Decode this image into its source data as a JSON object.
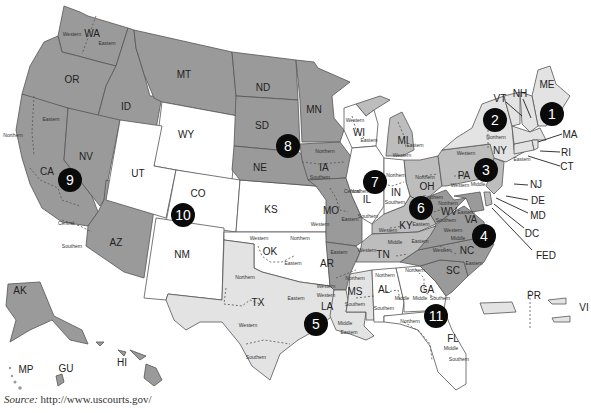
{
  "map": {
    "title": "U.S. Federal Judicial Circuits and Districts",
    "circuits": [
      {
        "number": "1",
        "x": 552,
        "y": 25
      },
      {
        "number": "2",
        "x": 496,
        "y": 120
      },
      {
        "number": "3",
        "x": 488,
        "y": 170
      },
      {
        "number": "4",
        "x": 484,
        "y": 236
      },
      {
        "number": "5",
        "x": 315,
        "y": 323
      },
      {
        "number": "6",
        "x": 422,
        "y": 207
      },
      {
        "number": "7",
        "x": 376,
        "y": 183
      },
      {
        "number": "8",
        "x": 289,
        "y": 148
      },
      {
        "number": "9",
        "x": 70,
        "y": 180
      },
      {
        "number": "10",
        "x": 183,
        "y": 214
      },
      {
        "number": "11",
        "x": 437,
        "y": 316
      }
    ],
    "states": {
      "WA": "WA",
      "OR": "OR",
      "ID": "ID",
      "MT": "MT",
      "WY": "WY",
      "ND": "ND",
      "SD": "SD",
      "MN": "MN",
      "NE": "NE",
      "IA": "IA",
      "CA": "CA",
      "NV": "NV",
      "UT": "UT",
      "CO": "CO",
      "KS": "KS",
      "AZ": "AZ",
      "NM": "NM",
      "OK": "OK",
      "TX": "TX",
      "MO": "MO",
      "AR": "AR",
      "LA": "LA",
      "MS": "MS",
      "AL": "AL",
      "TN": "TN",
      "KY": "KY",
      "GA": "GA",
      "FL": "FL",
      "SC": "SC",
      "NC": "NC",
      "VA": "VA",
      "WV": "WV",
      "OH": "OH",
      "IN": "IN",
      "IL": "IL",
      "WI": "WI",
      "MI": "MI",
      "PA": "PA",
      "NY": "NY",
      "VT": "VT",
      "NH": "NH",
      "ME": "ME",
      "MA": "MA",
      "RI": "RI",
      "CT": "CT",
      "NJ": "NJ",
      "DE": "DE",
      "MD": "MD",
      "DC": "DC",
      "FED": "FED",
      "AK": "AK",
      "HI": "HI",
      "GU": "GU",
      "MP": "MP",
      "PR": "PR",
      "VI": "VI"
    },
    "districts": {
      "western": "Western",
      "eastern": "Eastern",
      "northern": "Northern",
      "southern": "Southern",
      "central": "Central",
      "middle": "Middle"
    }
  },
  "source": {
    "label": "Source:",
    "url": "http://www.uscourts.gov/"
  }
}
